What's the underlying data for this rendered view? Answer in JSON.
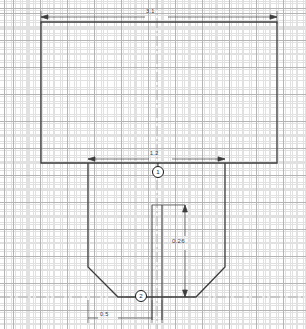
{
  "drawing": {
    "title": "Sectional Part View",
    "background_color": "#ffffff",
    "outline_color": "#3c3c3c",
    "grid": {
      "major_color": "#b4b4b4",
      "minor_color": "#d8d8d8",
      "major_spacing_px": 27,
      "minor_spacing_px": 6.75,
      "visible": true
    },
    "dimensions": [
      {
        "name": "top-width",
        "label": "3.1",
        "orientation": "horizontal",
        "x": 152,
        "y": 13
      },
      {
        "name": "mid-width",
        "label": "1.2",
        "orientation": "horizontal",
        "x": 156,
        "y": 155
      },
      {
        "name": "depth",
        "label": "0.26",
        "orientation": "vertical",
        "x": 183,
        "y": 241
      },
      {
        "name": "bottom-width",
        "label": "0.5",
        "orientation": "horizontal",
        "x": 105,
        "y": 315
      }
    ],
    "balloons": [
      {
        "name": "callout-1",
        "label": "1",
        "x": 158,
        "y": 172
      },
      {
        "name": "callout-2",
        "label": "2",
        "x": 141,
        "y": 296
      }
    ],
    "geometry": {
      "upper_rect": {
        "left": 41,
        "top": 22,
        "right": 277,
        "bottom": 163
      },
      "lower_body": {
        "left": 88,
        "top": 163,
        "right": 225,
        "bottom": 297,
        "chamfer": 30
      },
      "center_lines": [
        152,
        162
      ]
    }
  }
}
